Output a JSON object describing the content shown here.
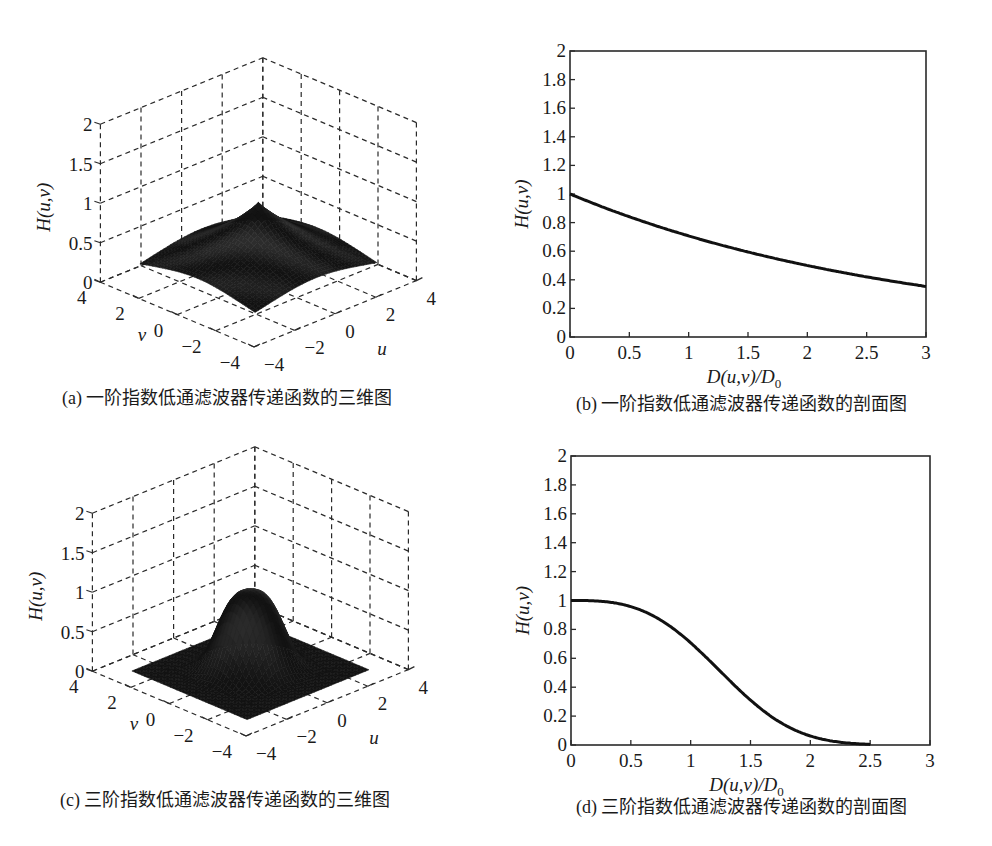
{
  "chart_data": [
    {
      "id": "a",
      "type": "surface",
      "caption": "(a) 一阶指数低通滤波器传递函数的三维图",
      "function": "H(u,v) = exp(-0.347 * (D(u,v)/D0)^n)",
      "order": 1,
      "zlabel": "H(u,v)",
      "xlabel": "u",
      "ylabel": "v",
      "xlim": [
        -4,
        4
      ],
      "ylim": [
        -4,
        4
      ],
      "zlim": [
        0,
        2
      ],
      "xticks": [
        -4,
        -2,
        0,
        2,
        4
      ],
      "yticks": [
        -4,
        -2,
        0,
        2,
        4
      ],
      "zticks": [
        0,
        0.5,
        1,
        1.5,
        2
      ],
      "xtick_labels": [
        "−4",
        "−2",
        "0",
        "2",
        "4"
      ],
      "ytick_labels": [
        "−4",
        "−2",
        "0",
        "2",
        "4"
      ],
      "ztick_labels": [
        "0",
        "0.5",
        "1",
        "1.5",
        "2"
      ],
      "surface_range": [
        -3,
        3
      ],
      "peak": 1,
      "grid": true
    },
    {
      "id": "b",
      "type": "line",
      "caption": "(b) 一阶指数低通滤波器传递函数的剖面图",
      "order": 1,
      "xlabel": "D(u,v)/D0",
      "xlabel_main": "D(u,v)/D",
      "xlabel_sub": "0",
      "ylabel": "H(u,v)",
      "xlim": [
        0,
        3
      ],
      "ylim": [
        0,
        2
      ],
      "xticks": [
        0,
        0.5,
        1,
        1.5,
        2,
        2.5,
        3
      ],
      "yticks": [
        0,
        0.2,
        0.4,
        0.6,
        0.8,
        1,
        1.2,
        1.4,
        1.6,
        1.8,
        2
      ],
      "xtick_labels": [
        "0",
        "0.5",
        "1",
        "1.5",
        "2",
        "2.5",
        "3"
      ],
      "ytick_labels": [
        "0",
        "0.2",
        "0.4",
        "0.6",
        "0.8",
        "1",
        "1.2",
        "1.4",
        "1.6",
        "1.8",
        "2"
      ],
      "x": [
        0,
        0.25,
        0.5,
        0.75,
        1,
        1.25,
        1.5,
        1.75,
        2,
        2.25,
        2.5,
        2.75,
        3
      ],
      "y": [
        1.0,
        0.917,
        0.841,
        0.771,
        0.707,
        0.648,
        0.594,
        0.545,
        0.5,
        0.458,
        0.42,
        0.385,
        0.353
      ],
      "grid": false
    },
    {
      "id": "c",
      "type": "surface",
      "caption": "(c) 三阶指数低通滤波器传递函数的三维图",
      "function": "H(u,v) = exp(-0.347 * (D(u,v)/D0)^n)",
      "order": 3,
      "zlabel": "H(u,v)",
      "xlabel": "u",
      "ylabel": "v",
      "xlim": [
        -4,
        4
      ],
      "ylim": [
        -4,
        4
      ],
      "zlim": [
        0,
        2
      ],
      "xticks": [
        -4,
        -2,
        0,
        2,
        4
      ],
      "yticks": [
        -4,
        -2,
        0,
        2,
        4
      ],
      "zticks": [
        0,
        0.5,
        1,
        1.5,
        2
      ],
      "xtick_labels": [
        "−4",
        "−2",
        "0",
        "2",
        "4"
      ],
      "ytick_labels": [
        "−4",
        "−2",
        "0",
        "2",
        "4"
      ],
      "ztick_labels": [
        "0",
        "0.5",
        "1",
        "1.5",
        "2"
      ],
      "surface_range": [
        -3,
        3
      ],
      "peak": 1,
      "grid": true
    },
    {
      "id": "d",
      "type": "line",
      "caption": "(d) 三阶指数低通滤波器传递函数的剖面图",
      "order": 3,
      "xlabel": "D(u,v)/D0",
      "xlabel_main": "D(u,v)/D",
      "xlabel_sub": "0",
      "ylabel": "H(u,v)",
      "xlim": [
        0,
        3
      ],
      "ylim": [
        0,
        2
      ],
      "xticks": [
        0,
        0.5,
        1,
        1.5,
        2,
        2.5,
        3
      ],
      "yticks": [
        0,
        0.2,
        0.4,
        0.6,
        0.8,
        1,
        1.2,
        1.4,
        1.6,
        1.8,
        2
      ],
      "xtick_labels": [
        "0",
        "0.5",
        "1",
        "1.5",
        "2",
        "2.5",
        "3"
      ],
      "ytick_labels": [
        "0",
        "0.2",
        "0.4",
        "0.6",
        "0.8",
        "1",
        "1.2",
        "1.4",
        "1.6",
        "1.8",
        "2"
      ],
      "x": [
        0,
        0.25,
        0.5,
        0.75,
        1,
        1.25,
        1.5,
        1.75,
        2,
        2.25,
        2.5
      ],
      "y": [
        1.0,
        0.995,
        0.958,
        0.864,
        0.707,
        0.508,
        0.31,
        0.155,
        0.062,
        0.018,
        0.004
      ],
      "grid": false
    }
  ]
}
